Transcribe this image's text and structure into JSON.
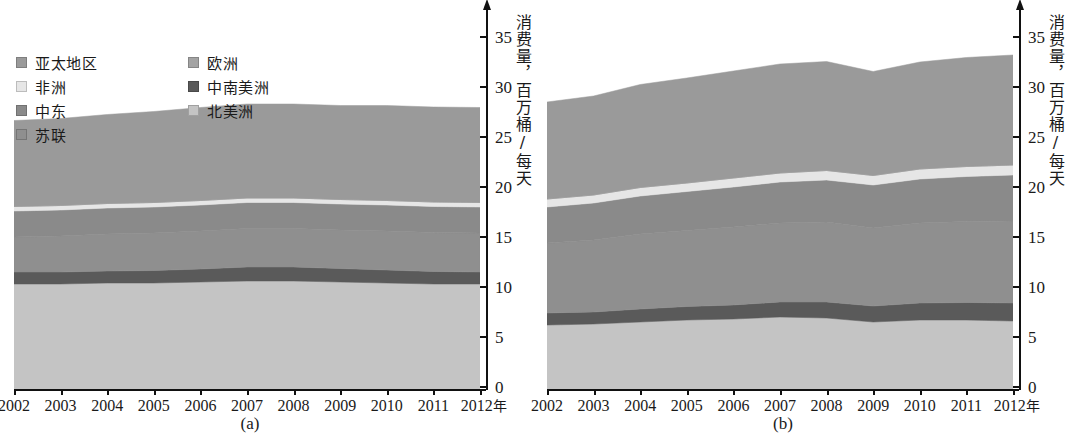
{
  "figure": {
    "yaxis_title": "消费量，百万桶/每天",
    "x_unit": "年",
    "y_ticks": [
      "0",
      "5",
      "10",
      "15",
      "20",
      "25",
      "30",
      "35"
    ],
    "x_ticks": [
      "2002",
      "2003",
      "2004",
      "2005",
      "2006",
      "2007",
      "2008",
      "2009",
      "2010",
      "2011",
      "2012"
    ]
  },
  "legend": {
    "col1": [
      {
        "label": "亚太地区",
        "color": "#9a9a9a"
      },
      {
        "label": "非洲",
        "color": "#e6e6e6"
      },
      {
        "label": "中东",
        "color": "#8a8a8a"
      },
      {
        "label": "苏联",
        "color": "#8f8f8f"
      }
    ],
    "col2": [
      {
        "label": "欧洲",
        "color": "#a3a3a3"
      },
      {
        "label": "中南美洲",
        "color": "#5a5a5a"
      },
      {
        "label": "北美洲",
        "color": "#c4c4c4"
      }
    ]
  },
  "panels": [
    {
      "id": "a",
      "caption": "(a)"
    },
    {
      "id": "b",
      "caption": "(b)"
    }
  ],
  "chart_data": {
    "type": "area",
    "title": "",
    "xlabel": "年",
    "ylabel": "消费量，百万桶/每天",
    "ylim": [
      0,
      35
    ],
    "grid": false,
    "legend_position": "upper-left",
    "x": [
      2002,
      2003,
      2004,
      2005,
      2006,
      2007,
      2008,
      2009,
      2010,
      2011,
      2012
    ],
    "panels": [
      {
        "id": "a",
        "caption": "(a)",
        "stack_order_bottom_to_top": [
          "北美洲",
          "中南美洲",
          "苏联",
          "中东",
          "非洲",
          "欧洲",
          "亚太地区"
        ],
        "series": [
          {
            "name": "北美洲",
            "color": "#c4c4c4",
            "values": [
              10.6,
              10.6,
              10.7,
              10.7,
              10.8,
              10.9,
              10.9,
              10.8,
              10.7,
              10.6,
              10.6
            ]
          },
          {
            "name": "中南美洲",
            "color": "#5a5a5a",
            "values": [
              1.2,
              1.2,
              1.2,
              1.25,
              1.3,
              1.4,
              1.4,
              1.35,
              1.3,
              1.25,
              1.2
            ]
          },
          {
            "name": "苏联",
            "color": "#8f8f8f",
            "values": [
              3.5,
              3.6,
              3.7,
              3.75,
              3.8,
              3.85,
              3.85,
              3.85,
              3.9,
              3.9,
              3.9
            ]
          },
          {
            "name": "中东",
            "color": "#8a8a8a",
            "values": [
              2.6,
              2.6,
              2.6,
              2.6,
              2.6,
              2.6,
              2.6,
              2.6,
              2.6,
              2.6,
              2.6
            ]
          },
          {
            "name": "非洲",
            "color": "#e6e6e6",
            "values": [
              0.45,
              0.45,
              0.45,
              0.45,
              0.45,
              0.45,
              0.45,
              0.45,
              0.45,
              0.45,
              0.45
            ]
          },
          {
            "name": "欧洲",
            "color": "#a3a3a3",
            "values": [
              0.0,
              0.0,
              0.0,
              0.0,
              0.0,
              0.0,
              0.0,
              0.0,
              0.0,
              0.0,
              0.0
            ]
          },
          {
            "name": "亚太地区",
            "color": "#9a9a9a",
            "values": [
              8.6,
              8.7,
              8.9,
              9.1,
              9.3,
              9.4,
              9.4,
              9.4,
              9.5,
              9.5,
              9.5
            ]
          }
        ],
        "totals": [
          27.0,
          27.2,
          27.6,
          27.9,
          28.3,
          28.6,
          28.6,
          28.4,
          28.5,
          28.3,
          28.3
        ]
      },
      {
        "id": "b",
        "caption": "(b)",
        "stack_order_bottom_to_top": [
          "北美洲",
          "中南美洲",
          "苏联",
          "中东",
          "非洲",
          "欧洲",
          "亚太地区"
        ],
        "series": [
          {
            "name": "北美洲",
            "color": "#c4c4c4",
            "values": [
              6.5,
              6.6,
              6.8,
              7.0,
              7.1,
              7.3,
              7.2,
              6.8,
              7.0,
              7.0,
              6.9
            ]
          },
          {
            "name": "中南美洲",
            "color": "#5a5a5a",
            "values": [
              1.2,
              1.2,
              1.3,
              1.35,
              1.4,
              1.5,
              1.6,
              1.6,
              1.7,
              1.75,
              1.8
            ]
          },
          {
            "name": "苏联",
            "color": "#8f8f8f",
            "values": [
              7.0,
              7.2,
              7.5,
              7.6,
              7.8,
              7.9,
              8.0,
              7.8,
              8.0,
              8.1,
              8.2
            ]
          },
          {
            "name": "中东",
            "color": "#8a8a8a",
            "values": [
              3.6,
              3.7,
              3.8,
              3.9,
              4.0,
              4.1,
              4.2,
              4.3,
              4.4,
              4.5,
              4.6
            ]
          },
          {
            "name": "非洲",
            "color": "#e6e6e6",
            "values": [
              0.8,
              0.8,
              0.85,
              0.85,
              0.9,
              0.9,
              0.95,
              0.95,
              1.0,
              1.0,
              1.0
            ]
          },
          {
            "name": "欧洲",
            "color": "#a3a3a3",
            "values": [
              0.0,
              0.0,
              0.0,
              0.0,
              0.0,
              0.0,
              0.0,
              0.0,
              0.0,
              0.0,
              0.0
            ]
          },
          {
            "name": "亚太地区",
            "color": "#9a9a9a",
            "values": [
              9.7,
              9.9,
              10.3,
              10.5,
              10.7,
              10.9,
              10.9,
              10.4,
              10.7,
              10.9,
              11.0
            ]
          }
        ],
        "totals": [
          28.8,
          29.4,
          30.55,
          31.2,
          31.9,
          32.6,
          32.85,
          31.85,
          32.8,
          33.25,
          33.5
        ]
      }
    ]
  }
}
